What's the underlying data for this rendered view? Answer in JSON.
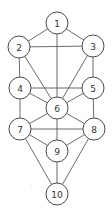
{
  "diagram": {
    "type": "graph",
    "background": "#ffffff",
    "node_radius": 11,
    "nodes": [
      {
        "id": "1",
        "label": "1",
        "x": 57,
        "y": 23
      },
      {
        "id": "2",
        "label": "2",
        "x": 19,
        "y": 47
      },
      {
        "id": "3",
        "label": "3",
        "x": 93,
        "y": 46
      },
      {
        "id": "4",
        "label": "4",
        "x": 20,
        "y": 88
      },
      {
        "id": "5",
        "label": "5",
        "x": 93,
        "y": 88
      },
      {
        "id": "6",
        "label": "6",
        "x": 57,
        "y": 108
      },
      {
        "id": "7",
        "label": "7",
        "x": 20,
        "y": 129
      },
      {
        "id": "8",
        "label": "8",
        "x": 94,
        "y": 129
      },
      {
        "id": "9",
        "label": "9",
        "x": 57,
        "y": 151
      },
      {
        "id": "10",
        "label": "10",
        "x": 57,
        "y": 194
      }
    ],
    "edges": [
      [
        "1",
        "2"
      ],
      [
        "1",
        "3"
      ],
      [
        "1",
        "6"
      ],
      [
        "2",
        "3"
      ],
      [
        "2",
        "4"
      ],
      [
        "2",
        "6"
      ],
      [
        "3",
        "5"
      ],
      [
        "3",
        "6"
      ],
      [
        "4",
        "5"
      ],
      [
        "4",
        "6"
      ],
      [
        "4",
        "7"
      ],
      [
        "5",
        "6"
      ],
      [
        "5",
        "8"
      ],
      [
        "6",
        "7"
      ],
      [
        "6",
        "8"
      ],
      [
        "6",
        "9"
      ],
      [
        "7",
        "8"
      ],
      [
        "7",
        "9"
      ],
      [
        "7",
        "10"
      ],
      [
        "8",
        "9"
      ],
      [
        "8",
        "10"
      ],
      [
        "9",
        "10"
      ]
    ]
  }
}
